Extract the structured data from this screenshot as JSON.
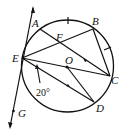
{
  "diagram": {
    "type": "geometry-circle",
    "circle": {
      "center": "O",
      "cx": 67.5,
      "cy": 66,
      "r": 46
    },
    "points": {
      "A": {
        "label": "A",
        "x": 40,
        "y": 29
      },
      "B": {
        "label": "B",
        "x": 93,
        "y": 29
      },
      "C": {
        "label": "C",
        "x": 110,
        "y": 76
      },
      "D": {
        "label": "D",
        "x": 94,
        "y": 102
      },
      "E": {
        "label": "E",
        "x": 22,
        "y": 58
      },
      "F": {
        "label": "F",
        "x": 59,
        "y": 44
      },
      "O": {
        "label": "O",
        "x": 67,
        "y": 67
      },
      "G": {
        "label": "G",
        "x": 13,
        "y": 112
      }
    },
    "segments": [
      "AC",
      "EB",
      "BC",
      "EC",
      "ED",
      "OD"
    ],
    "tangent_line": {
      "through": "E",
      "label": "G"
    },
    "equal_arc_marks": [
      "arc AB",
      "arc BC"
    ],
    "angle_annotation": {
      "text": "20°",
      "at": "E"
    }
  },
  "labels": {
    "A": "A",
    "B": "B",
    "C": "C",
    "D": "D",
    "E": "E",
    "F": "F",
    "O": "O",
    "G": "G",
    "angle": "20°"
  },
  "colors": {
    "stroke": "#111111",
    "background": "#ffffff"
  }
}
